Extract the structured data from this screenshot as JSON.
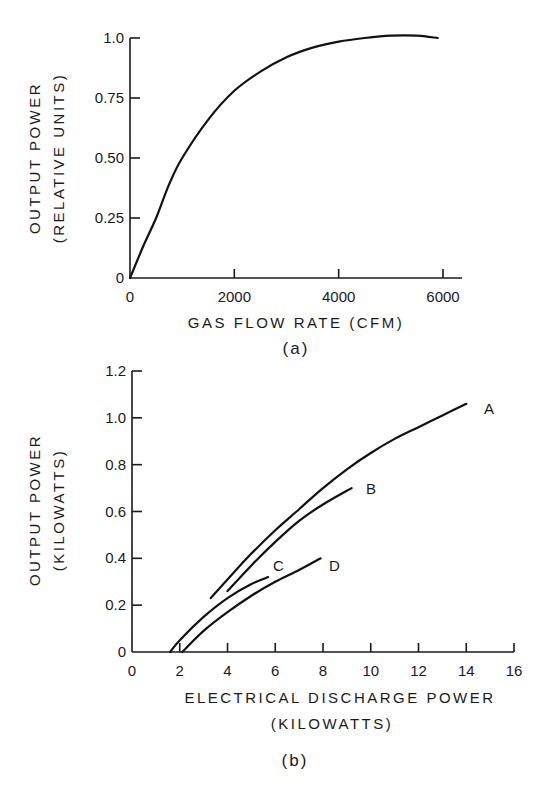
{
  "chart_data": [
    {
      "id": "a",
      "type": "line",
      "panel_label": "(a)",
      "title": "",
      "xlabel": "GAS FLOW RATE (CFM)",
      "ylabel": "OUTPUT POWER",
      "ylabel_line2": "(RELATIVE UNITS)",
      "xlim": [
        0,
        6400
      ],
      "ylim": [
        0,
        1.0
      ],
      "xticks": [
        0,
        2000,
        4000,
        6000
      ],
      "xtick_labels": [
        "0",
        "2000",
        "4000",
        "6000"
      ],
      "yticks": [
        0,
        0.25,
        0.5,
        0.75,
        1.0
      ],
      "ytick_labels": [
        "0",
        "0.25",
        "0.50",
        "0.75",
        "1.0"
      ],
      "grid": false,
      "legend": null,
      "series": [
        {
          "name": "output power",
          "x": [
            0,
            250,
            500,
            750,
            1000,
            1500,
            2000,
            2500,
            3000,
            3500,
            4000,
            4500,
            5000,
            5500,
            5900
          ],
          "y": [
            0,
            0.13,
            0.25,
            0.39,
            0.5,
            0.66,
            0.78,
            0.86,
            0.92,
            0.96,
            0.985,
            1.0,
            1.01,
            1.01,
            1.0
          ]
        }
      ]
    },
    {
      "id": "b",
      "type": "line",
      "panel_label": "(b)",
      "title": "",
      "xlabel": "ELECTRICAL DISCHARGE POWER",
      "xlabel_line2": "(KILOWATTS)",
      "ylabel": "OUTPUT POWER",
      "ylabel_line2": "(KILOWATTS)",
      "xlim": [
        0,
        16
      ],
      "ylim": [
        0,
        1.2
      ],
      "xticks": [
        0,
        2,
        4,
        6,
        8,
        10,
        12,
        14,
        16
      ],
      "xtick_labels": [
        "0",
        "2",
        "4",
        "6",
        "8",
        "10",
        "12",
        "14",
        "16"
      ],
      "yticks": [
        0,
        0.2,
        0.4,
        0.6,
        0.8,
        1.0,
        1.2
      ],
      "ytick_labels": [
        "0",
        "0.2",
        "0.4",
        "0.6",
        "0.8",
        "1.0",
        "1.2"
      ],
      "grid": false,
      "legend": "inline curve labels",
      "series": [
        {
          "name": "A",
          "x": [
            3.3,
            4,
            5,
            6,
            7,
            8,
            9,
            10,
            11,
            12,
            13,
            14
          ],
          "y": [
            0.23,
            0.31,
            0.42,
            0.52,
            0.61,
            0.7,
            0.78,
            0.85,
            0.91,
            0.96,
            1.01,
            1.06
          ]
        },
        {
          "name": "B",
          "x": [
            4.0,
            5,
            6,
            7,
            8,
            9.2
          ],
          "y": [
            0.26,
            0.37,
            0.47,
            0.56,
            0.63,
            0.7
          ]
        },
        {
          "name": "C",
          "x": [
            1.6,
            2,
            3,
            4,
            5,
            5.7
          ],
          "y": [
            0.0,
            0.05,
            0.15,
            0.23,
            0.29,
            0.32
          ]
        },
        {
          "name": "D",
          "x": [
            2.1,
            3,
            4,
            5,
            6,
            7,
            7.9
          ],
          "y": [
            0.0,
            0.09,
            0.17,
            0.24,
            0.3,
            0.35,
            0.4
          ]
        }
      ]
    }
  ]
}
